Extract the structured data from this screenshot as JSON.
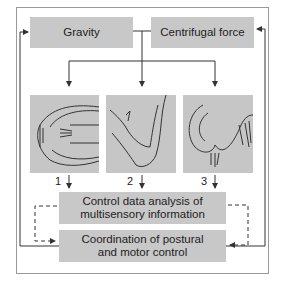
{
  "diagram": {
    "inputs": [
      {
        "label": "Gravity"
      },
      {
        "label": "Centrifugal force"
      }
    ],
    "sensors": [
      {
        "number": "1",
        "icon": "eye-icon"
      },
      {
        "number": "2",
        "icon": "arm-icon"
      },
      {
        "number": "3",
        "icon": "inner-ear-icon"
      }
    ],
    "processing": {
      "label": "Control data analysis of multisensory information"
    },
    "output": {
      "label": "Coordination of postural and motor control"
    },
    "colors": {
      "box_fill": "#c8c8c8",
      "line": "#333333",
      "frame": "#9a9a9a"
    }
  }
}
